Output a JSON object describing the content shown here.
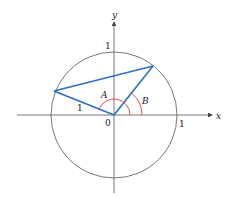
{
  "diagram": {
    "type": "unit-circle-angle-difference",
    "axes": {
      "x_label": "x",
      "y_label": "y"
    },
    "tick_labels": {
      "origin": "0",
      "x_one": "1",
      "y_one": "1"
    },
    "segment_label": "1",
    "angles": {
      "A": "A",
      "B": "B"
    },
    "colors": {
      "triangle": "#2f6fc4",
      "angle_arcs": "#e0403a",
      "axes": "#555555",
      "circle": "#555555"
    }
  }
}
